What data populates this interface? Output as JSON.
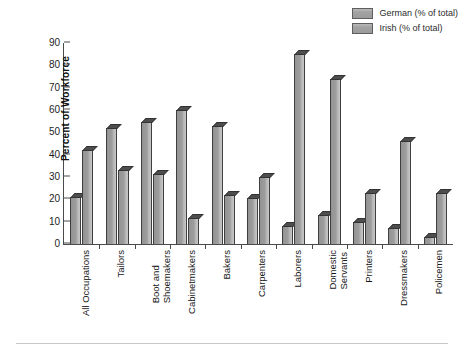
{
  "chart_data": {
    "type": "bar",
    "title": "",
    "xlabel": "",
    "ylabel": "Percent of Workforce",
    "ylim": [
      0,
      90
    ],
    "ytick_step": 10,
    "yticks": [
      0,
      10,
      20,
      30,
      40,
      50,
      60,
      70,
      80,
      90
    ],
    "grid": false,
    "legend_position": "top-right",
    "categories": [
      "All Occupations",
      "Tailors",
      "Boot and Shoemakers",
      "Cabinetmakers",
      "Bakers",
      "Carpenters",
      "Laborers",
      "Domestic Servants",
      "Printers",
      "Dressmakers",
      "Policemen"
    ],
    "category_lines": [
      [
        "All Occupations"
      ],
      [
        "Tailors"
      ],
      [
        "Boot and",
        "Shoemakers"
      ],
      [
        "Cabinetmakers"
      ],
      [
        "Bakers"
      ],
      [
        "Carpenters"
      ],
      [
        "Laborers"
      ],
      [
        "Domestic",
        "Servants"
      ],
      [
        "Printers"
      ],
      [
        "Dressmakers"
      ],
      [
        "Policemen"
      ]
    ],
    "series": [
      {
        "name": "German (% of total)",
        "color": "#9d9d9d",
        "values": [
          21,
          52,
          54.5,
          60,
          53,
          20.5,
          8,
          13,
          10,
          7,
          3
        ]
      },
      {
        "name": "Irish (% of total)",
        "color": "#9d9d9d",
        "values": [
          42,
          33,
          31.5,
          11.5,
          22,
          30,
          85,
          74,
          23,
          46,
          23
        ]
      }
    ]
  },
  "legend": {
    "items": [
      {
        "label": "German (% of total)",
        "swatch": "legend-swatch-german"
      },
      {
        "label": "Irish (% of total)",
        "swatch": "legend-swatch-irish"
      }
    ]
  },
  "axes": {
    "y_title": "Percent of Workforce"
  },
  "colors": {
    "bar_front": "#9d9d9d",
    "bar_top": "#4d4d4d",
    "bar_side": "#c8c8c8",
    "bar_outline": "#3f3f3f",
    "axis": "#4a4a4a",
    "background": "#ffffff"
  }
}
